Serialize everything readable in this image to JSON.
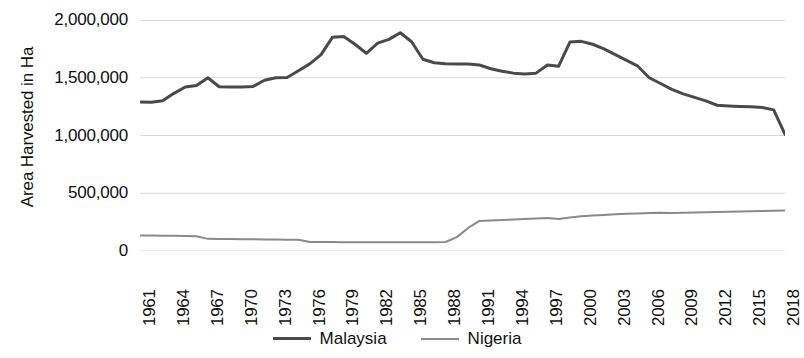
{
  "axes": {
    "y_title": "Area Harvested in Ha",
    "y_ticks": [
      "0",
      "500,000",
      "1,000,000",
      "1,500,000",
      "2,000,000"
    ],
    "x_ticks": [
      "1961",
      "1964",
      "1967",
      "1970",
      "1973",
      "1976",
      "1979",
      "1982",
      "1985",
      "1988",
      "1991",
      "1994",
      "1997",
      "2000",
      "2003",
      "2006",
      "2009",
      "2012",
      "2015",
      "2018"
    ]
  },
  "legend": {
    "items": [
      {
        "label": "Malaysia",
        "color": "#4a4a4a"
      },
      {
        "label": "Nigeria",
        "color": "#8a8a8a"
      }
    ]
  },
  "chart_data": {
    "type": "line",
    "title": "",
    "xlabel": "",
    "ylabel": "Area Harvested in Ha",
    "xlim": [
      1961,
      2018
    ],
    "ylim": [
      0,
      2000000
    ],
    "ytick_values": [
      0,
      500000,
      1000000,
      1500000,
      2000000
    ],
    "xtick_values": [
      1961,
      1964,
      1967,
      1970,
      1973,
      1976,
      1979,
      1982,
      1985,
      1988,
      1991,
      1994,
      1997,
      2000,
      2003,
      2006,
      2009,
      2012,
      2015,
      2018
    ],
    "grid": "horizontal",
    "legend_position": "bottom",
    "x": [
      1961,
      1962,
      1963,
      1964,
      1965,
      1966,
      1967,
      1968,
      1969,
      1970,
      1971,
      1972,
      1973,
      1974,
      1975,
      1976,
      1977,
      1978,
      1979,
      1980,
      1981,
      1982,
      1983,
      1984,
      1985,
      1986,
      1987,
      1988,
      1989,
      1990,
      1991,
      1992,
      1993,
      1994,
      1995,
      1996,
      1997,
      1998,
      1999,
      2000,
      2001,
      2002,
      2003,
      2004,
      2005,
      2006,
      2007,
      2008,
      2009,
      2010,
      2011,
      2012,
      2013,
      2014,
      2015,
      2016,
      2017,
      2018
    ],
    "series": [
      {
        "name": "Malaysia",
        "color": "#4a4a4a",
        "values": [
          1290000,
          1290000,
          1300000,
          1360000,
          1420000,
          1430000,
          1500000,
          1420000,
          1420000,
          1420000,
          1420000,
          1480000,
          1495000,
          1500000,
          1560000,
          1620000,
          1700000,
          1850000,
          1860000,
          1790000,
          1710000,
          1800000,
          1830000,
          1890000,
          1810000,
          1660000,
          1630000,
          1620000,
          1620000,
          1620000,
          1610000,
          1580000,
          1555000,
          1540000,
          1530000,
          1540000,
          1610000,
          1600000,
          1810000,
          1815000,
          1790000,
          1750000,
          1700000,
          1650000,
          1600000,
          1500000,
          1450000,
          1400000,
          1360000,
          1330000,
          1300000,
          1260000,
          1255000,
          1250000,
          1250000,
          1240000,
          1220000,
          1010000
        ]
      },
      {
        "name": "Nigeria",
        "color": "#8a8a8a",
        "values": [
          135000,
          134000,
          133000,
          132000,
          130000,
          128000,
          105000,
          104000,
          103000,
          102000,
          101000,
          100000,
          99000,
          98000,
          97000,
          78000,
          77000,
          77000,
          76000,
          76000,
          76000,
          76000,
          76000,
          76000,
          75000,
          75000,
          75000,
          78000,
          120000,
          200000,
          260000,
          265000,
          268000,
          272000,
          278000,
          282000,
          285000,
          278000,
          290000,
          300000,
          308000,
          312000,
          318000,
          322000,
          325000,
          330000,
          332000,
          330000,
          332000,
          334000,
          336000,
          338000,
          340000,
          342000,
          344000,
          346000,
          348000,
          350000
        ]
      }
    ]
  },
  "plot_paths": {
    "malaysia": [
      [
        1961,
        1290000
      ],
      [
        1962,
        1288000
      ],
      [
        1963,
        1300000
      ],
      [
        1964,
        1365000
      ],
      [
        1965,
        1420000
      ],
      [
        1966,
        1432000
      ],
      [
        1967,
        1500000
      ],
      [
        1968,
        1422000
      ],
      [
        1969,
        1420000
      ],
      [
        1970,
        1420000
      ],
      [
        1971,
        1425000
      ],
      [
        1972,
        1478000
      ],
      [
        1973,
        1500000
      ],
      [
        1974,
        1502000
      ],
      [
        1975,
        1560000
      ],
      [
        1976,
        1620000
      ],
      [
        1977,
        1700000
      ],
      [
        1978,
        1850000
      ],
      [
        1979,
        1858000
      ],
      [
        1980,
        1790000
      ],
      [
        1981,
        1712000
      ],
      [
        1982,
        1800000
      ],
      [
        1983,
        1832000
      ],
      [
        1984,
        1890000
      ],
      [
        1985,
        1812000
      ],
      [
        1986,
        1660000
      ],
      [
        1987,
        1630000
      ],
      [
        1988,
        1622000
      ],
      [
        1989,
        1620000
      ],
      [
        1990,
        1618000
      ],
      [
        1991,
        1610000
      ],
      [
        1992,
        1578000
      ],
      [
        1993,
        1556000
      ],
      [
        1994,
        1540000
      ],
      [
        1995,
        1532000
      ],
      [
        1996,
        1540000
      ],
      [
        1997,
        1610000
      ],
      [
        1998,
        1600000
      ],
      [
        1999,
        1810000
      ],
      [
        2000,
        1815000
      ],
      [
        2001,
        1790000
      ],
      [
        2002,
        1750000
      ],
      [
        2003,
        1700000
      ],
      [
        2004,
        1650000
      ],
      [
        2005,
        1600000
      ],
      [
        2006,
        1500000
      ],
      [
        2007,
        1450000
      ],
      [
        2008,
        1400000
      ],
      [
        2009,
        1360000
      ],
      [
        2010,
        1330000
      ],
      [
        2011,
        1300000
      ],
      [
        2012,
        1262000
      ],
      [
        2013,
        1256000
      ],
      [
        2014,
        1252000
      ],
      [
        2015,
        1250000
      ],
      [
        2016,
        1242000
      ],
      [
        2017,
        1222000
      ],
      [
        2018,
        1010000
      ]
    ]
  }
}
